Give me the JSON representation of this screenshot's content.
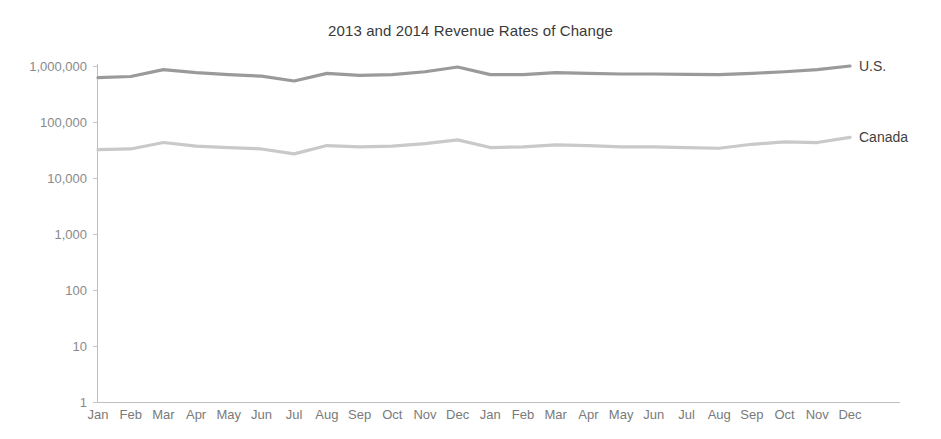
{
  "chart_data": {
    "type": "line",
    "title": "2013 and 2014 Revenue Rates of Change",
    "xlabel": "",
    "ylabel": "",
    "grid": false,
    "legend_position": "right-end-of-line",
    "y_scale": "log",
    "ylim": [
      1,
      1000000
    ],
    "y_ticks": [
      1,
      10,
      100,
      1000,
      10000,
      100000,
      1000000
    ],
    "y_tick_labels": [
      "1",
      "10",
      "100",
      "1,000",
      "10,000",
      "100,000",
      "1,000,000"
    ],
    "categories": [
      "Jan",
      "Feb",
      "Mar",
      "Apr",
      "May",
      "Jun",
      "Jul",
      "Aug",
      "Sep",
      "Oct",
      "Nov",
      "Dec",
      "Jan",
      "Feb",
      "Mar",
      "Apr",
      "May",
      "Jun",
      "Jul",
      "Aug",
      "Sep",
      "Oct",
      "Nov",
      "Dec"
    ],
    "series": [
      {
        "name": "U.S.",
        "color": "#9a9a9a",
        "values": [
          620000,
          650000,
          860000,
          760000,
          700000,
          660000,
          540000,
          740000,
          680000,
          700000,
          790000,
          960000,
          700000,
          700000,
          760000,
          740000,
          720000,
          720000,
          710000,
          700000,
          740000,
          790000,
          860000,
          1000000
        ]
      },
      {
        "name": "Canada",
        "color": "#c9c9c9",
        "values": [
          32000,
          33000,
          43000,
          37000,
          35000,
          33000,
          27000,
          38000,
          36000,
          37000,
          41000,
          48000,
          35000,
          36000,
          39000,
          38000,
          36000,
          36000,
          35000,
          34000,
          40000,
          44000,
          43000,
          53000
        ]
      }
    ]
  },
  "axis": {
    "y_tick_labels": [
      "1,000,000",
      "100,000",
      "10,000",
      "1,000",
      "100",
      "10",
      "1"
    ],
    "x_tick_labels": [
      "Jan",
      "Feb",
      "Mar",
      "Apr",
      "May",
      "Jun",
      "Jul",
      "Aug",
      "Sep",
      "Oct",
      "Nov",
      "Dec",
      "Jan",
      "Feb",
      "Mar",
      "Apr",
      "May",
      "Jun",
      "Jul",
      "Aug",
      "Sep",
      "Oct",
      "Nov",
      "Dec"
    ]
  },
  "series_labels": {
    "us": "U.S.",
    "canada": "Canada"
  }
}
